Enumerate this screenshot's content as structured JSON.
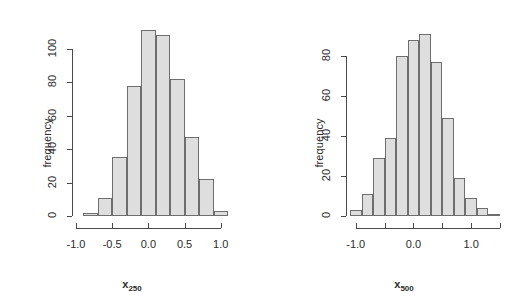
{
  "figure": {
    "background_color": "#ffffff",
    "bar_fill_color": "#dedede",
    "bar_border_color": "#6e6e6e",
    "axis_color": "#4a4a4a",
    "text_color": "#2b2b2b"
  },
  "chart_data": [
    {
      "type": "bar",
      "title": "",
      "subtitle": "",
      "xlabel": "x250",
      "xlabel_base": "x",
      "xlabel_sub": "250",
      "ylabel": "frequency",
      "grid": false,
      "legend": "none",
      "xlim": [
        -1.0,
        1.1
      ],
      "ylim": [
        0,
        113
      ],
      "xticks": [
        -1.0,
        -0.5,
        0.0,
        0.5,
        1.0
      ],
      "xticklabels": [
        "-1.0",
        "-0.5",
        "0.0",
        "0.5",
        "1.0"
      ],
      "yticks": [
        0,
        20,
        40,
        60,
        80,
        100
      ],
      "yticklabels": [
        "0",
        "20",
        "40",
        "60",
        "80",
        "100"
      ],
      "bin_width": 0.2,
      "bin_edges": [
        -0.9,
        -0.7,
        -0.5,
        -0.3,
        -0.1,
        0.1,
        0.3,
        0.5,
        0.7,
        0.9,
        1.1
      ],
      "categories": [
        "-0.9 to -0.7",
        "-0.7 to -0.5",
        "-0.5 to -0.3",
        "-0.3 to -0.1",
        "-0.1 to 0.1",
        "0.1 to 0.3",
        "0.3 to 0.5",
        "0.5 to 0.7",
        "0.7 to 0.9",
        "0.9 to 1.1"
      ],
      "values": [
        2,
        11,
        35,
        78,
        111,
        108,
        82,
        47,
        22,
        3
      ]
    },
    {
      "type": "bar",
      "title": "",
      "subtitle": "",
      "xlabel": "x500",
      "xlabel_base": "x",
      "xlabel_sub": "500",
      "ylabel": "frequency",
      "grid": false,
      "legend": "none",
      "xlim": [
        -1.1,
        1.5
      ],
      "ylim": [
        0,
        93
      ],
      "xticks": [
        -1.0,
        -0.5,
        0.0,
        0.5,
        1.0,
        1.5
      ],
      "xticklabels": [
        "-1.0",
        "",
        "0.0",
        "",
        "1.0",
        ""
      ],
      "yticks": [
        0,
        20,
        40,
        60,
        80
      ],
      "yticklabels": [
        "0",
        "20",
        "40",
        "60",
        "80"
      ],
      "bin_width": 0.2,
      "bin_edges": [
        -1.1,
        -0.9,
        -0.7,
        -0.5,
        -0.3,
        -0.1,
        0.1,
        0.3,
        0.5,
        0.7,
        0.9,
        1.1,
        1.3,
        1.5
      ],
      "categories": [
        "-1.1 to -0.9",
        "-0.9 to -0.7",
        "-0.7 to -0.5",
        "-0.5 to -0.3",
        "-0.3 to -0.1",
        "-0.1 to 0.1",
        "0.1 to 0.3",
        "0.3 to 0.5",
        "0.5 to 0.7",
        "0.7 to 0.9",
        "0.9 to 1.1",
        "1.1 to 1.3",
        "1.3 to 1.5"
      ],
      "values": [
        3,
        11,
        29,
        39,
        80,
        88,
        91,
        77,
        49,
        19,
        9,
        4,
        1
      ]
    }
  ]
}
